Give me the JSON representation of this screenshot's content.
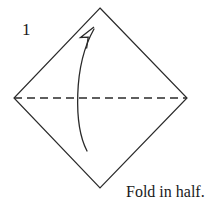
{
  "figure": {
    "step_label": "1",
    "caption": "Fold in half.",
    "background_color": "#ffffff",
    "line_color": "#2a2a2a",
    "text_color": "#1a1a1a"
  },
  "diagram": {
    "type": "origami-instruction",
    "shape": {
      "name": "square-rotated-diamond",
      "vertices": [
        {
          "name": "top",
          "x": 100,
          "y": 8
        },
        {
          "name": "right",
          "x": 187,
          "y": 98
        },
        {
          "name": "bottom",
          "x": 100,
          "y": 188
        },
        {
          "name": "left",
          "x": 14,
          "y": 98
        }
      ],
      "stroke_width": 1.2
    },
    "fold_line": {
      "name": "valley-fold-dashed-line",
      "x1": 14,
      "y1": 98,
      "x2": 187,
      "y2": 98,
      "dash": "8 5",
      "stroke_width": 1.3
    },
    "fold_arrow": {
      "name": "curved-fold-arrow",
      "direction": "bottom-to-top",
      "path": "M 87 151 C 74 126, 73 66, 94 29",
      "head": {
        "tip_x": 94,
        "tip_y": 27,
        "points": "94,27 80,38 88,38 86,48"
      },
      "stroke_width": 1.3
    }
  }
}
